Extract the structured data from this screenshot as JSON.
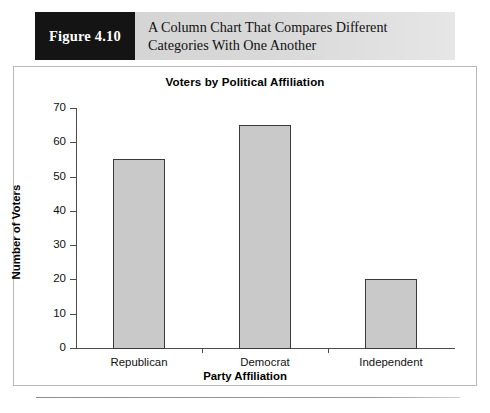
{
  "figure": {
    "number_label": "Figure 4.10",
    "caption": "A Column Chart That Compares Different Categories With One Another"
  },
  "colors": {
    "banner_dark": "#141414",
    "banner_light": "#d6d6d6",
    "bar_fill": "#c9c9c9",
    "bar_border": "#3a3a3a",
    "axis": "#4d4d4d",
    "frame_border": "#b9b9b9"
  },
  "chart_data": {
    "type": "bar",
    "title": "Voters by Political Affiliation",
    "xlabel": "Party Affiliation",
    "ylabel": "Number of Voters",
    "categories": [
      "Republican",
      "Democrat",
      "Independent"
    ],
    "values": [
      55,
      65,
      20
    ],
    "ylim": [
      0,
      70
    ],
    "yticks": [
      0,
      10,
      20,
      30,
      40,
      50,
      60,
      70
    ],
    "ytick_labels": [
      "0",
      "10",
      "20",
      "30",
      "40",
      "50",
      "60",
      "70"
    ],
    "grid": false,
    "legend": false,
    "legend_position": "none",
    "bar_width_fraction": 0.42
  }
}
